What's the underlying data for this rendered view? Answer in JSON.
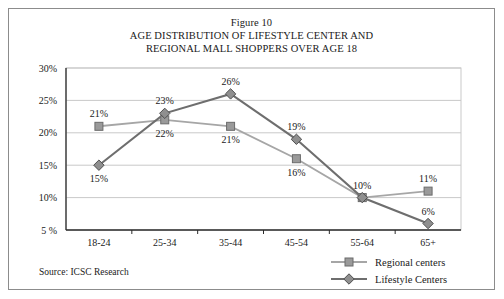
{
  "figure": {
    "number_label": "Figure 10",
    "title_line1": "AGE DISTRIBUTION OF LIFESTYLE CENTER AND",
    "title_line2": "REGIONAL MALL SHOPPERS OVER AGE 18"
  },
  "source": {
    "text": "Source: ICSC Research"
  },
  "colors": {
    "regional_line": "#a6a6a6",
    "regional_marker_fill": "#9a9a9a",
    "regional_marker_stroke": "#6b6b6b",
    "lifestyle_line": "#6e6e6e",
    "lifestyle_marker_fill": "#8f8f8f",
    "lifestyle_marker_stroke": "#4f4f4f",
    "axis": "#2b2b2b",
    "gridline": "#c9c9c9",
    "plot_border": "#c9c9c9",
    "frame": "#8c8c8c",
    "text": "#1a1a1a"
  },
  "chart_data": {
    "type": "line",
    "title": "AGE DISTRIBUTION OF LIFESTYLE CENTER AND REGIONAL MALL SHOPPERS OVER AGE 18",
    "xlabel": "",
    "ylabel": "",
    "categories": [
      "18-24",
      "25-34",
      "35-44",
      "45-54",
      "55-64",
      "65+"
    ],
    "ylim": [
      5,
      30
    ],
    "ytick_values": [
      30,
      25,
      20,
      15,
      10,
      5
    ],
    "ytick_labels": [
      "30%",
      "25%",
      "20%",
      "15%",
      "10%",
      "5 %"
    ],
    "grid": true,
    "legend_position": "bottom-right",
    "series": [
      {
        "name": "Regional centers",
        "marker": "square",
        "values": [
          21,
          22,
          21,
          16,
          10,
          11
        ],
        "point_labels": [
          "21%",
          "22%",
          "21%",
          "16%",
          "10%",
          "11%"
        ],
        "label_positions": [
          "above",
          "below",
          "below",
          "below",
          "hidden",
          "above"
        ]
      },
      {
        "name": "Lifestyle Centers",
        "marker": "diamond",
        "values": [
          15,
          23,
          26,
          19,
          10,
          6
        ],
        "point_labels": [
          "15%",
          "23%",
          "26%",
          "19%",
          "10%",
          "6%"
        ],
        "label_positions": [
          "below",
          "above",
          "above",
          "above",
          "above",
          "above"
        ]
      }
    ]
  }
}
